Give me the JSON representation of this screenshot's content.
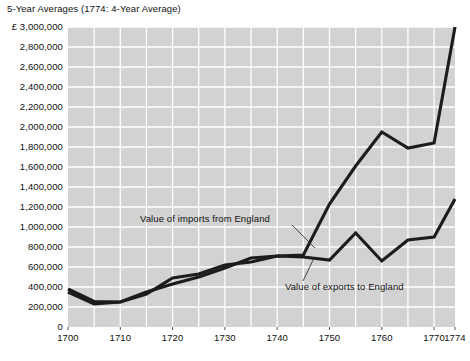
{
  "chart_data": {
    "type": "line",
    "title": "5-Year Averages (1774: 4-Year Average)",
    "xlabel": "",
    "ylabel": "",
    "currency_symbol": "£",
    "xlim": [
      1700,
      1774
    ],
    "ylim": [
      0,
      3000000
    ],
    "grid": true,
    "legend_position": "inline-annotations",
    "y_ticks": [
      0,
      200000,
      400000,
      600000,
      800000,
      1000000,
      1200000,
      1400000,
      1600000,
      1800000,
      2000000,
      2200000,
      2400000,
      2600000,
      2800000,
      3000000
    ],
    "y_tick_labels": [
      "0",
      "200,000",
      "400,000",
      "600,000",
      "800,000",
      "1,000,000",
      "1,200,000",
      "1,400,000",
      "1,600,000",
      "1,800,000",
      "2,000,000",
      "2,200,000",
      "2,400,000",
      "2,600,000",
      "2,800,000",
      "£ 3,000,000"
    ],
    "x_ticks": [
      1700,
      1710,
      1720,
      1730,
      1740,
      1750,
      1760,
      1770,
      1774
    ],
    "x_tick_labels": [
      "1700",
      "1710",
      "1720",
      "1730",
      "1740",
      "1750",
      "1760",
      "1770",
      "1774"
    ],
    "x_gridlines": [
      1705,
      1710,
      1715,
      1720,
      1725,
      1730,
      1735,
      1740,
      1745,
      1750,
      1755,
      1760,
      1765,
      1770
    ],
    "x": [
      1700,
      1705,
      1710,
      1715,
      1720,
      1725,
      1730,
      1735,
      1740,
      1745,
      1750,
      1755,
      1760,
      1765,
      1770,
      1774
    ],
    "series": [
      {
        "name": "Value of imports from England",
        "values": [
          380000,
          255000,
          250000,
          350000,
          430000,
          500000,
          590000,
          690000,
          710000,
          720000,
          1230000,
          1610000,
          1950000,
          1790000,
          1840000,
          3000000
        ]
      },
      {
        "name": "Value of exports to England",
        "values": [
          350000,
          230000,
          250000,
          330000,
          490000,
          530000,
          620000,
          650000,
          710000,
          700000,
          670000,
          940000,
          660000,
          870000,
          900000,
          1280000
        ]
      }
    ],
    "annotations": [
      {
        "text": "Value of imports from England",
        "target_year": 1750,
        "target_value": 1230000
      },
      {
        "text": "Value of exports to England",
        "target_year": 1750,
        "target_value": 670000
      }
    ]
  }
}
